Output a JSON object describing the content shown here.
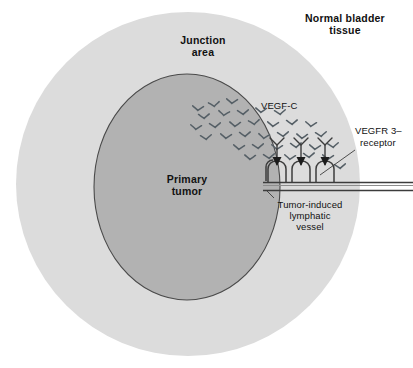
{
  "figure": {
    "title_alt": "Tumor-induced lymphangiogenesis in bladder cancer",
    "background_color": "#ffffff"
  },
  "regions": {
    "normal_tissue": {
      "label_line1": "Normal bladder",
      "label_line2": "tissue",
      "color": "#ffffff",
      "bold": true
    },
    "junction_area": {
      "label_line1": "Junction",
      "label_line2": "area",
      "color": "#dcdcdc",
      "bold": true
    },
    "primary_tumor": {
      "label_line1": "Primary",
      "label_line2": "tumor",
      "color": "#b2b2b2",
      "stroke": "#4a4a4a",
      "bold": true
    }
  },
  "annotations": {
    "vegf_c": {
      "label": "VEGF-C",
      "bold": false
    },
    "vegfr3": {
      "label_line1": "VEGFR 3–",
      "label_line2": "receptor",
      "bold": false
    },
    "lymphatic_vessel": {
      "label_line1": "Tumor-induced",
      "label_line2": "lymphatic",
      "label_line3": "vessel",
      "bold": false
    }
  },
  "chart_data": {
    "type": "diagram",
    "elements": [
      {
        "name": "outer-circle-normal-bladder-tissue",
        "shape": "circle",
        "cx": 188,
        "cy": 184,
        "r": 172,
        "fill": "#dcdcdc"
      },
      {
        "name": "inner-ellipse-primary-tumor",
        "shape": "ellipse",
        "cx": 187,
        "cy": 187,
        "rx": 93,
        "ry": 113,
        "fill": "#b2b2b2",
        "stroke": "#4a4a4a"
      },
      {
        "name": "lymphatic-vessel",
        "shape": "double-line",
        "y_top": 182,
        "y_bottom": 190,
        "x_start": 263,
        "x_end": 413
      },
      {
        "name": "vessel-sprout-arches",
        "count": 3,
        "x_positions": [
          277,
          301,
          325
        ]
      },
      {
        "name": "vegfr3-receptors",
        "count": 3,
        "x_positions": [
          277,
          301,
          325
        ]
      },
      {
        "name": "vegf-c-molecules",
        "count": 34,
        "glyph": "bird-v"
      }
    ],
    "legend_position": "none",
    "grid": false
  },
  "vegf_molecules": [
    {
      "x": 214,
      "y": 104,
      "s": 1.0,
      "r": -6
    },
    {
      "x": 232,
      "y": 101,
      "s": 1.0,
      "r": 4
    },
    {
      "x": 204,
      "y": 116,
      "s": 1.0,
      "r": -3
    },
    {
      "x": 224,
      "y": 113,
      "s": 1.0,
      "r": 6
    },
    {
      "x": 243,
      "y": 112,
      "s": 1.0,
      "r": -4
    },
    {
      "x": 261,
      "y": 110,
      "s": 1.0,
      "r": 3
    },
    {
      "x": 280,
      "y": 112,
      "s": 1.0,
      "r": -5
    },
    {
      "x": 196,
      "y": 127,
      "s": 1.0,
      "r": 5
    },
    {
      "x": 215,
      "y": 125,
      "s": 1.0,
      "r": -4
    },
    {
      "x": 235,
      "y": 124,
      "s": 1.0,
      "r": 3
    },
    {
      "x": 254,
      "y": 122,
      "s": 1.0,
      "r": -6
    },
    {
      "x": 273,
      "y": 124,
      "s": 1.0,
      "r": 4
    },
    {
      "x": 292,
      "y": 122,
      "s": 1.0,
      "r": -3
    },
    {
      "x": 311,
      "y": 124,
      "s": 1.0,
      "r": 5
    },
    {
      "x": 206,
      "y": 137,
      "s": 1.0,
      "r": -5
    },
    {
      "x": 226,
      "y": 136,
      "s": 1.0,
      "r": 4
    },
    {
      "x": 245,
      "y": 134,
      "s": 1.0,
      "r": -3
    },
    {
      "x": 264,
      "y": 136,
      "s": 1.0,
      "r": 6
    },
    {
      "x": 283,
      "y": 134,
      "s": 1.0,
      "r": -4
    },
    {
      "x": 302,
      "y": 136,
      "s": 1.0,
      "r": 3
    },
    {
      "x": 321,
      "y": 134,
      "s": 1.0,
      "r": -5
    },
    {
      "x": 239,
      "y": 147,
      "s": 1.0,
      "r": 4
    },
    {
      "x": 258,
      "y": 146,
      "s": 1.0,
      "r": -4
    },
    {
      "x": 277,
      "y": 147,
      "s": 1.0,
      "r": 5
    },
    {
      "x": 296,
      "y": 145,
      "s": 1.0,
      "r": -3
    },
    {
      "x": 315,
      "y": 147,
      "s": 1.0,
      "r": 4
    },
    {
      "x": 333,
      "y": 145,
      "s": 1.0,
      "r": -5
    },
    {
      "x": 250,
      "y": 157,
      "s": 1.0,
      "r": 3
    },
    {
      "x": 269,
      "y": 156,
      "s": 1.0,
      "r": -4
    },
    {
      "x": 290,
      "y": 157,
      "s": 1.0,
      "r": 5
    },
    {
      "x": 309,
      "y": 155,
      "s": 1.0,
      "r": -3
    },
    {
      "x": 328,
      "y": 157,
      "s": 1.0,
      "r": 4
    },
    {
      "x": 340,
      "y": 166,
      "s": 1.0,
      "r": -4
    },
    {
      "x": 198,
      "y": 108,
      "s": 1.0,
      "r": 4
    }
  ]
}
